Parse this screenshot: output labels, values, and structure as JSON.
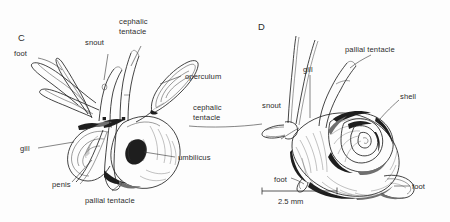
{
  "figure": {
    "background_color": "#fefefe",
    "ink_color": "#2d2d2d",
    "panels": [
      {
        "letter": "C",
        "name": "panel-c",
        "description": "ventral view of snail with extended foot, snout and tentacles"
      },
      {
        "letter": "D",
        "name": "panel-d",
        "description": "lateral view of snail showing coiled shell"
      }
    ]
  },
  "panel_c": {
    "letter": "C",
    "labels": {
      "foot": "foot",
      "snout": "snout",
      "cephalic_tentacle_line1": "cephalic",
      "cephalic_tentacle_line2": "tentacle",
      "operculum": "operculum",
      "gill": "gill",
      "penis": "penis",
      "pallial_tentacle": "pallial tentacle",
      "umbilicus": "umbilicus"
    }
  },
  "panel_d": {
    "letter": "D",
    "labels": {
      "pallial_tentacle": "pallial tentacle",
      "gill": "gill",
      "snout": "snout",
      "shell": "shell",
      "foot_left": "foot",
      "foot_right": "foot",
      "cephalic_tentacle_line1": "cephalic",
      "cephalic_tentacle_line2": "tentacle"
    },
    "scale_bar": {
      "label": "2.5 mm",
      "value": 2.5,
      "unit": "mm"
    }
  }
}
